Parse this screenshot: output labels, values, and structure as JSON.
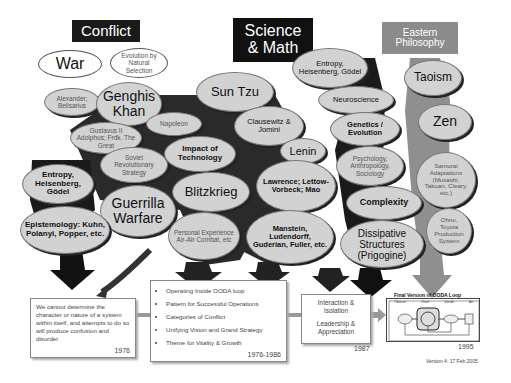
{
  "headers": {
    "conflict": "Conflict",
    "science": "Science & Math",
    "eastern": "Eastern Philosophy"
  },
  "conflict": {
    "war": "War",
    "evolution": "Evolution by Natural Selection",
    "alexander": "Alexander; Belisarius",
    "genghis": "Genghis Khan",
    "gustavus": "Gustavus II Adolphus; Frdk. The Great",
    "napoleon": "Napoleon",
    "soviet": "Soviet Revolutionary Strategy",
    "impact": "Impact of Technology",
    "entropy_left": "Entropy, Heisenberg, Gödel",
    "guerrilla": "Guerrilla Warfare",
    "blitzkrieg": "Blitzkrieg",
    "epistemology": "Epistemology: Kuhn, Polanyi, Popper, etc.",
    "personal": "Personal Experience Air-Air Combat, etc"
  },
  "science": {
    "sun_tzu": "Sun Tzu",
    "clausewitz": "Clausewitz & Jomini",
    "lenin": "Lenin",
    "lawrence": "Lawrence; Lettow-Vorbeck; Mao",
    "manstein": "Manstein, Ludendorff, Guderian, Fuller, etc.",
    "entropy": "Entropy, Heisenberg, Gödel",
    "neuroscience": "Neuroscience",
    "genetics": "Genetics / Evolution",
    "psychology": "Psychology, Anthropology, Sociology",
    "complexity": "Complexity",
    "dissipative": "Dissipative Structures (Prigogine)"
  },
  "eastern": {
    "taoism": "Taoism",
    "zen": "Zen",
    "samurai": "Samurai Adaptations (Musashi, Takuan, Cleary, etc.)",
    "ohno": "Ohno, Toyota Production System"
  },
  "timeline": {
    "box1": {
      "text": "We cannot determine the character or nature of a system within itself, and attempts to do so will produce confusion and disorder",
      "year": "1976"
    },
    "box2": {
      "items": [
        "Operating Inside OODA loop",
        "Pattern for Successful Operations",
        "Categories of Conflict",
        "Unifying Vision and Grand Strategy",
        "Theme for Vitality & Growth"
      ],
      "year": "1976-1986"
    },
    "box3": {
      "line1": "Interaction & Isolation",
      "line2": "Leadership & Appreciation",
      "year": "1987"
    },
    "box4": {
      "title": "Final Version of OODA Loop",
      "labels": [
        "Observe",
        "Orient",
        "Decide",
        "Act"
      ],
      "year": "1995"
    }
  },
  "footer": {
    "version": "Version 4: 17 Feb 2005"
  },
  "colors": {
    "black_header": "#1a1a1a",
    "gray_header": "#8c8c8c",
    "ellipse_fill": "#d2d2d2",
    "tree_dark": "#2a2a2a",
    "tree_gray": "#8f8f8f"
  }
}
